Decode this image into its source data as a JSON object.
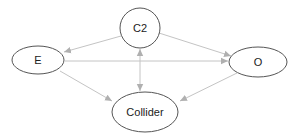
{
  "diagram": {
    "type": "causal-dag",
    "nodes": [
      {
        "id": "C2",
        "label": "C2",
        "shape": "circle"
      },
      {
        "id": "E",
        "label": "E",
        "shape": "ellipse"
      },
      {
        "id": "O",
        "label": "O",
        "shape": "ellipse"
      },
      {
        "id": "Collider",
        "label": "Collider",
        "shape": "ellipse"
      }
    ],
    "edges": [
      {
        "from": "C2",
        "to": "E",
        "direction": "forward"
      },
      {
        "from": "C2",
        "to": "O",
        "direction": "forward"
      },
      {
        "from": "E",
        "to": "O",
        "direction": "forward"
      },
      {
        "from": "C2",
        "to": "Collider",
        "direction": "bidirectional"
      },
      {
        "from": "E",
        "to": "Collider",
        "direction": "forward"
      },
      {
        "from": "O",
        "to": "Collider",
        "direction": "forward"
      }
    ],
    "colors": {
      "node_stroke": "#555555",
      "edge": "#c4c4c4",
      "arrowhead": "#b0b0b0",
      "text": "#222222",
      "background": "#ffffff"
    }
  }
}
